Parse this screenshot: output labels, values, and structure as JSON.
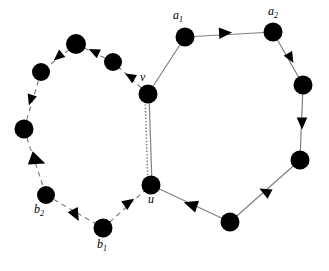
{
  "figure": {
    "background_color": "#ffffff",
    "edge_color": "#808080",
    "node_color": "#000000",
    "arrow_color": "#000000",
    "width": 329,
    "height": 271
  },
  "labels": {
    "a1": {
      "text": "a",
      "sub": "1",
      "x": 173,
      "y": 9
    },
    "a2": {
      "text": "a",
      "sub": "2",
      "x": 268,
      "y": 5
    },
    "v": {
      "text": "v",
      "sub": "",
      "x": 140,
      "y": 71
    },
    "u": {
      "text": "u",
      "sub": "",
      "x": 148,
      "y": 193
    },
    "b1": {
      "text": "b",
      "sub": "1",
      "x": 97,
      "y": 238
    },
    "b2": {
      "text": "b",
      "sub": "2",
      "x": 34,
      "y": 203
    }
  },
  "nodes": [
    {
      "id": "v",
      "x": 148,
      "y": 94,
      "r": 9.5
    },
    {
      "id": "u",
      "x": 151,
      "y": 185,
      "r": 9.5
    },
    {
      "id": "a1",
      "x": 185,
      "y": 37,
      "r": 9.5
    },
    {
      "id": "a2",
      "x": 273,
      "y": 32,
      "r": 9.5
    },
    {
      "id": "r1",
      "x": 303,
      "y": 85,
      "r": 9.5
    },
    {
      "id": "r2",
      "x": 300,
      "y": 160,
      "r": 9.5
    },
    {
      "id": "r3",
      "x": 230,
      "y": 222,
      "r": 9.5
    },
    {
      "id": "l1",
      "x": 113,
      "y": 62,
      "r": 9.0
    },
    {
      "id": "l2",
      "x": 76,
      "y": 44,
      "r": 10.0
    },
    {
      "id": "l3",
      "x": 41,
      "y": 72,
      "r": 9.0
    },
    {
      "id": "l4",
      "x": 24,
      "y": 129,
      "r": 9.5
    },
    {
      "id": "b2",
      "x": 46,
      "y": 195,
      "r": 9.0
    },
    {
      "id": "b1",
      "x": 103,
      "y": 228,
      "r": 9.5
    }
  ],
  "edges": [
    {
      "from": "v",
      "to": "a1",
      "style": "solid",
      "cycle": "right"
    },
    {
      "from": "a1",
      "to": "a2",
      "style": "solid",
      "cycle": "right"
    },
    {
      "from": "a2",
      "to": "r1",
      "style": "solid",
      "cycle": "right"
    },
    {
      "from": "r1",
      "to": "r2",
      "style": "solid",
      "cycle": "right"
    },
    {
      "from": "r2",
      "to": "r3",
      "style": "solid",
      "cycle": "right"
    },
    {
      "from": "r3",
      "to": "u",
      "style": "solid",
      "cycle": "right"
    },
    {
      "from": "u",
      "to": "v",
      "style": "solid",
      "cycle": "shared"
    },
    {
      "from": "u",
      "to": "v",
      "style": "dotted",
      "cycle": "shared"
    },
    {
      "from": "v",
      "to": "l1",
      "style": "dashed",
      "cycle": "left"
    },
    {
      "from": "l1",
      "to": "l2",
      "style": "dashed",
      "cycle": "left"
    },
    {
      "from": "l2",
      "to": "l3",
      "style": "dashed",
      "cycle": "left"
    },
    {
      "from": "l3",
      "to": "l4",
      "style": "dashed",
      "cycle": "left"
    },
    {
      "from": "l4",
      "to": "b2",
      "style": "dashed",
      "cycle": "left"
    },
    {
      "from": "b2",
      "to": "b1",
      "style": "dashed",
      "cycle": "left"
    },
    {
      "from": "b1",
      "to": "u",
      "style": "dashed",
      "cycle": "left"
    }
  ],
  "arrowheads": [
    {
      "name": "a1-a2",
      "x": 224,
      "y": 33,
      "angle": -3,
      "size": 13
    },
    {
      "name": "a2-r1",
      "x": 290,
      "y": 57,
      "angle": 60,
      "size": 11
    },
    {
      "name": "r1-r2",
      "x": 302,
      "y": 122,
      "angle": 90,
      "size": 12
    },
    {
      "name": "r2-r3",
      "x": 266,
      "y": 192,
      "angle": 208,
      "size": 12
    },
    {
      "name": "r3-u",
      "x": 192,
      "y": 205,
      "angle": 198,
      "size": 14
    },
    {
      "name": "v-l1",
      "x": 131,
      "y": 77,
      "angle": 210,
      "size": 11
    },
    {
      "name": "l1-l2",
      "x": 95,
      "y": 52,
      "angle": 205,
      "size": 11
    },
    {
      "name": "l2-l3",
      "x": 59,
      "y": 56,
      "angle": 140,
      "size": 11
    },
    {
      "name": "l3-l4",
      "x": 31,
      "y": 99,
      "angle": 108,
      "size": 11
    },
    {
      "name": "l4-b2",
      "x": 36,
      "y": 160,
      "angle": 20,
      "size": 16
    },
    {
      "name": "b2-b1",
      "x": 75,
      "y": 214,
      "angle": 62,
      "size": 13
    },
    {
      "name": "b1-u",
      "x": 128,
      "y": 203,
      "angle": -35,
      "size": 12
    }
  ]
}
